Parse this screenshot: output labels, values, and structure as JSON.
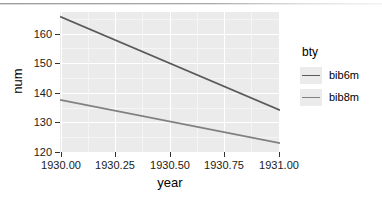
{
  "chart_data": {
    "type": "line",
    "title": "",
    "xlabel": "year",
    "ylabel": "num",
    "xlim": [
      1930.0,
      1931.0
    ],
    "ylim": [
      118.5,
      165.5
    ],
    "x_ticks": [
      1930.0,
      1930.25,
      1930.5,
      1930.75,
      1931.0
    ],
    "x_tick_labels": [
      "1930.00",
      "1930.25",
      "1930.50",
      "1930.75",
      "1931.00"
    ],
    "y_ticks": [
      120,
      130,
      140,
      150,
      160
    ],
    "y_tick_labels": [
      "120",
      "130",
      "140",
      "150",
      "160"
    ],
    "grid": true,
    "legend_position": "right",
    "legend_title": "bty",
    "series": [
      {
        "name": "bib6m",
        "color": "#5a5a5a",
        "x": [
          1930.0,
          1931.0
        ],
        "values": [
          164.0,
          132.5
        ]
      },
      {
        "name": "bib8m",
        "color": "#808080",
        "x": [
          1930.0,
          1931.0
        ],
        "values": [
          136.0,
          121.5
        ]
      }
    ]
  },
  "axes": {
    "x_title": "year",
    "y_title": "num",
    "x_tick_labels": [
      "1930.00",
      "1930.25",
      "1930.50",
      "1930.75",
      "1931.00"
    ],
    "y_tick_labels": [
      "120",
      "130",
      "140",
      "150",
      "160"
    ]
  },
  "legend": {
    "title": "bty",
    "items": [
      {
        "label": "bib6m",
        "color": "#5a5a5a"
      },
      {
        "label": "bib8m",
        "color": "#808080"
      }
    ]
  },
  "theme": {
    "panel_background": "#ebebeb",
    "major_gridline": "#ffffff",
    "minor_gridline": "#f5f5f5",
    "text_color": "#1a1a1a",
    "page_background": "#ffffff"
  }
}
